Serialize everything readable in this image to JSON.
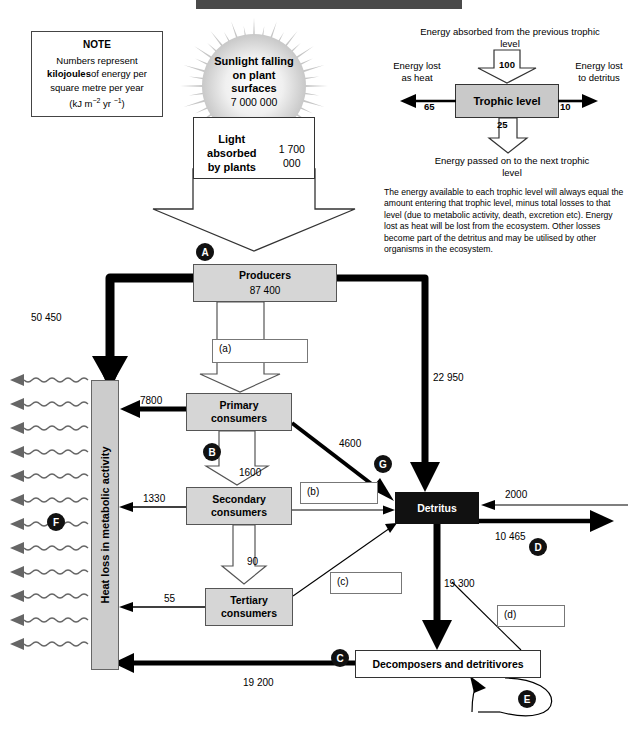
{
  "note": {
    "title": "NOTE",
    "line1": "Numbers represent",
    "bold": "kilojoules",
    "line2": "of energy per",
    "line3": "square metre per year",
    "units_prefix": "(kJ m",
    "units_sup1": "−2",
    "units_mid": " yr ",
    "units_sup2": "−1",
    "units_suffix": ")"
  },
  "sun": {
    "label": "Sunlight falling\non plant\nsurfaces",
    "value": "7 000 000"
  },
  "light_absorbed": {
    "label": "Light absorbed\nby plants",
    "value": "1 700 000"
  },
  "key": {
    "top_text": "Energy absorbed from the previous trophic level",
    "in_value": "100",
    "box_label": "Trophic level",
    "left_label": "Energy lost as heat",
    "left_value": "65",
    "right_label": "Energy lost to detritus",
    "right_value": "10",
    "down_value": "25",
    "bottom_text": "Energy passed on to the next trophic level",
    "paragraph": "The energy available to each trophic level will always equal the amount entering that trophic level, minus total losses to that level (due to metabolic activity, death, excretion etc). Energy lost as heat will be lost from the ecosystem. Other losses become part of the detritus and may be utilised by other organisms in the ecosystem."
  },
  "boxes": {
    "producers": {
      "label": "Producers",
      "value": "87 400"
    },
    "primary": {
      "label": "Primary\nconsumers"
    },
    "secondary": {
      "label": "Secondary\nconsumers"
    },
    "tertiary": {
      "label": "Tertiary\nconsumers"
    },
    "detritus": {
      "label": "Detritus"
    },
    "decomposers": {
      "label": "Decomposers and detritivores"
    },
    "heat_loss": {
      "label": "Heat loss in metabolic activity"
    }
  },
  "answer_boxes": {
    "a": "(a)",
    "b": "(b)",
    "c": "(c)",
    "d": "(d)"
  },
  "marks": {
    "a": "A",
    "b": "B",
    "c": "C",
    "d": "D",
    "e": "E",
    "f": "F",
    "g": "G"
  },
  "flows": {
    "producers_to_heat": "50 450",
    "producers_to_detritus": "22 950",
    "primary_to_heat": "7800",
    "primary_to_detritus": "4600",
    "primary_to_secondary": "1600",
    "secondary_to_heat": "1330",
    "secondary_to_tertiary": "90",
    "tertiary_to_heat": "55",
    "detritus_in_right": "2000",
    "detritus_out_right": "10 465",
    "detritus_to_decomposers": "19 300",
    "decomposers_to_heat": "19 200"
  },
  "chart_data": {
    "type": "diagram",
    "units": "kJ m^-2 yr^-1",
    "nodes": [
      {
        "id": "sunlight",
        "label": "Sunlight falling on plant surfaces",
        "value": 7000000
      },
      {
        "id": "light_absorbed",
        "label": "Light absorbed by plants",
        "value": 1700000
      },
      {
        "id": "producers",
        "label": "Producers",
        "value": 87400
      },
      {
        "id": "primary",
        "label": "Primary consumers",
        "value": null
      },
      {
        "id": "secondary",
        "label": "Secondary consumers",
        "value": null
      },
      {
        "id": "tertiary",
        "label": "Tertiary consumers",
        "value": null
      },
      {
        "id": "detritus",
        "label": "Detritus",
        "value": null
      },
      {
        "id": "decomposers",
        "label": "Decomposers and detritivores",
        "value": null
      },
      {
        "id": "heat",
        "label": "Heat loss in metabolic activity",
        "value": null
      }
    ],
    "edges": [
      {
        "from": "sunlight",
        "to": "light_absorbed",
        "value": null
      },
      {
        "from": "light_absorbed",
        "to": "producers",
        "value": null,
        "mark": "A"
      },
      {
        "from": "producers",
        "to": "heat",
        "value": 50450
      },
      {
        "from": "producers",
        "to": "detritus",
        "value": 22950
      },
      {
        "from": "producers",
        "to": "primary",
        "value": null,
        "mark": "(a)"
      },
      {
        "from": "primary",
        "to": "heat",
        "value": 7800
      },
      {
        "from": "primary",
        "to": "detritus",
        "value": 4600,
        "mark": "G"
      },
      {
        "from": "primary",
        "to": "secondary",
        "value": 1600,
        "mark": "B"
      },
      {
        "from": "secondary",
        "to": "heat",
        "value": 1330
      },
      {
        "from": "secondary",
        "to": "detritus",
        "value": null,
        "mark": "(b)"
      },
      {
        "from": "secondary",
        "to": "tertiary",
        "value": 90
      },
      {
        "from": "tertiary",
        "to": "heat",
        "value": 55
      },
      {
        "from": "tertiary",
        "to": "detritus",
        "value": null,
        "mark": "(c)"
      },
      {
        "from": "external",
        "to": "detritus",
        "value": 2000
      },
      {
        "from": "detritus",
        "to": "external",
        "value": 10465,
        "mark": "D"
      },
      {
        "from": "detritus",
        "to": "decomposers",
        "value": 19300
      },
      {
        "from": "decomposers",
        "to": "heat",
        "value": 19200,
        "mark": "C"
      },
      {
        "from": "decomposers",
        "to": "decomposers",
        "value": null,
        "mark": "E"
      },
      {
        "from": "decomposers",
        "to": "detritus",
        "value": null,
        "mark": "(d)"
      }
    ],
    "key_example": {
      "in": 100,
      "heat": 65,
      "detritus": 10,
      "passed_on": 25
    }
  }
}
